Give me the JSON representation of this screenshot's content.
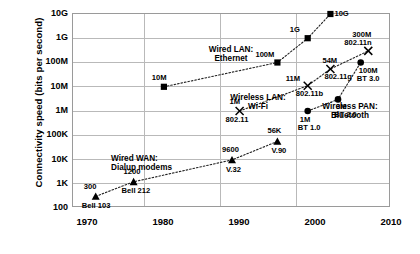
{
  "chart_data": {
    "type": "scatter",
    "title": "",
    "xlabel": "",
    "ylabel": "Connectivity speed (bits per second)",
    "xlim": [
      1968,
      2010
    ],
    "ylim_log": [
      100,
      10000000000
    ],
    "grid": true,
    "legend": "inline-annotations",
    "x_ticks": [
      "1970",
      "1980",
      "1990",
      "2000",
      "2010"
    ],
    "x_tick_values": [
      1970,
      1980,
      1990,
      2000,
      2010
    ],
    "y_ticks": [
      "100",
      "1K",
      "10K",
      "100K",
      "1M",
      "10M",
      "100M",
      "1G",
      "10G"
    ],
    "y_tick_values": [
      100,
      1000,
      10000,
      100000,
      1000000,
      10000000,
      100000000,
      1000000000,
      10000000000
    ],
    "series": [
      {
        "name": "Wired LAN: Ethernet",
        "marker": "square",
        "label_lines": [
          "Wired LAN:",
          "Ethernet"
        ],
        "points": [
          {
            "x": 1980,
            "y": 10000000,
            "value_label": "10M",
            "name_label": ""
          },
          {
            "x": 1995,
            "y": 100000000,
            "value_label": "100M",
            "name_label": ""
          },
          {
            "x": 1999,
            "y": 1000000000,
            "value_label": "1G",
            "name_label": ""
          },
          {
            "x": 2002,
            "y": 10000000000,
            "value_label": "10G",
            "name_label": ""
          }
        ]
      },
      {
        "name": "Wireless LAN: Wi-Fi",
        "marker": "x",
        "label_lines": [
          "Wireless LAN:",
          "Wi-Fi"
        ],
        "points": [
          {
            "x": 1990,
            "y": 1000000,
            "value_label": "1M",
            "name_label": "802.11"
          },
          {
            "x": 1999,
            "y": 11000000,
            "value_label": "11M",
            "name_label": "802.11b"
          },
          {
            "x": 2002,
            "y": 54000000,
            "value_label": "54M",
            "name_label": "802.11g"
          },
          {
            "x": 2007,
            "y": 300000000,
            "value_label": "300M",
            "name_label": "802.11n"
          }
        ]
      },
      {
        "name": "Wireless PAN: Bluetooth",
        "marker": "circle",
        "label_lines": [
          "Wireless PAN:",
          "Bluetooth"
        ],
        "points": [
          {
            "x": 1999,
            "y": 1000000,
            "value_label": "1M",
            "name_label": "BT 1.0"
          },
          {
            "x": 2003,
            "y": 3000000,
            "value_label": "3M",
            "name_label": "BT 2.0"
          },
          {
            "x": 2006,
            "y": 100000000,
            "value_label": "100M",
            "name_label": "BT 3.0"
          }
        ]
      },
      {
        "name": "Wired WAN: Dialup modems",
        "marker": "triangle",
        "label_lines": [
          "Wired WAN:",
          "Dialup modems"
        ],
        "points": [
          {
            "x": 1971,
            "y": 300,
            "value_label": "300",
            "name_label": "Bell 103"
          },
          {
            "x": 1976,
            "y": 1200,
            "value_label": "1200",
            "name_label": "Bell 212"
          },
          {
            "x": 1989,
            "y": 9600,
            "value_label": "9600",
            "name_label": "V.32"
          },
          {
            "x": 1995,
            "y": 56000,
            "value_label": "56K",
            "name_label": "V.90"
          }
        ]
      }
    ],
    "colors": {
      "marker": "#000000",
      "line": "#222222",
      "grid": "#b9b9b9",
      "frame": "#9a9a9a",
      "background": "#ffffff"
    }
  }
}
